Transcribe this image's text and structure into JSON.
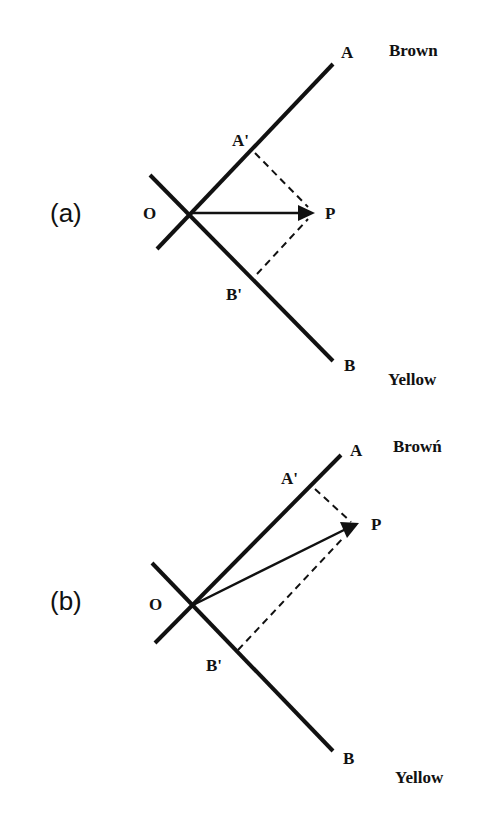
{
  "figure": {
    "panels": [
      {
        "id": "a",
        "panel_label": "(a)",
        "labels": {
          "origin": "O",
          "axis_a": "A",
          "axis_b": "B",
          "a_proj": "A'",
          "b_proj": "B'",
          "point": "P",
          "color_a": "Brown",
          "color_b": "Yellow"
        }
      },
      {
        "id": "b",
        "panel_label": "(b)",
        "labels": {
          "origin": "O",
          "axis_a": "A",
          "axis_b": "B",
          "a_proj": "A'",
          "b_proj": "B'",
          "point": "P",
          "color_a": "Browń",
          "color_b": "Yellow"
        }
      }
    ]
  }
}
